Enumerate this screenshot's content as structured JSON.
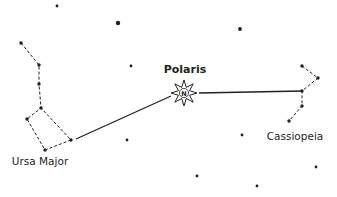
{
  "diagram": {
    "colors": {
      "background": "#ffffff",
      "ink": "#231f20"
    },
    "labels": [
      {
        "id": "polaris",
        "text": "Polaris",
        "x": 185,
        "y": 64,
        "weight": "bold"
      },
      {
        "id": "ursa-major",
        "text": "Ursa Major",
        "x": 40,
        "y": 156,
        "weight": "regular"
      },
      {
        "id": "cassiopeia",
        "text": "Cassiopeia",
        "x": 295,
        "y": 131,
        "weight": "regular"
      }
    ],
    "polaris": {
      "x": 184,
      "y": 93,
      "icon": "compass-star-icon",
      "letter": "N"
    },
    "constellations": {
      "ursa_major": {
        "name": "Ursa Major",
        "stars": [
          [
            21,
            43
          ],
          [
            39,
            65
          ],
          [
            39,
            84
          ],
          [
            41,
            108
          ],
          [
            27,
            119
          ],
          [
            45,
            150
          ],
          [
            71,
            140
          ]
        ],
        "dashed_path": [
          [
            21,
            43
          ],
          [
            39,
            65
          ],
          [
            39,
            84
          ],
          [
            41,
            108
          ],
          [
            27,
            119
          ],
          [
            45,
            150
          ],
          [
            71,
            140
          ],
          [
            41,
            108
          ]
        ]
      },
      "cassiopeia": {
        "name": "Cassiopeia",
        "stars": [
          [
            302,
            66
          ],
          [
            318,
            78
          ],
          [
            302,
            91
          ],
          [
            302,
            106
          ],
          [
            289,
            121
          ]
        ],
        "dashed_path": [
          [
            302,
            66
          ],
          [
            318,
            78
          ],
          [
            302,
            91
          ],
          [
            302,
            106
          ],
          [
            289,
            121
          ]
        ]
      }
    },
    "pointer_lines": [
      {
        "from": [
          76,
          139
        ],
        "to": [
          171,
          96
        ]
      },
      {
        "from": [
          199,
          93
        ],
        "to": [
          302,
          91
        ]
      }
    ],
    "field_stars": [
      {
        "x": 57,
        "y": 6,
        "r": 1.4
      },
      {
        "x": 118,
        "y": 23,
        "r": 2.2
      },
      {
        "x": 240,
        "y": 29,
        "r": 1.9
      },
      {
        "x": 131,
        "y": 66,
        "r": 1.4
      },
      {
        "x": 127,
        "y": 140,
        "r": 1.4
      },
      {
        "x": 242,
        "y": 135,
        "r": 1.4
      },
      {
        "x": 316,
        "y": 167,
        "r": 1.4
      },
      {
        "x": 197,
        "y": 176,
        "r": 1.4
      },
      {
        "x": 257,
        "y": 186,
        "r": 1.4
      }
    ]
  }
}
